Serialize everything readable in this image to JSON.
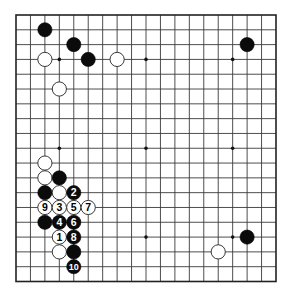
{
  "board": {
    "size": 19,
    "colors": {
      "background": "#ffffff",
      "line": "#3a3a3a",
      "black_stone": "#0b0b0b",
      "white_stone": "#ffffff"
    },
    "hoshi": [
      [
        3,
        3
      ],
      [
        9,
        3
      ],
      [
        15,
        3
      ],
      [
        3,
        9
      ],
      [
        9,
        9
      ],
      [
        15,
        9
      ],
      [
        3,
        15
      ],
      [
        9,
        15
      ],
      [
        15,
        15
      ]
    ],
    "stones": [
      {
        "col": 2,
        "row": 1,
        "color": "black",
        "label": ""
      },
      {
        "col": 4,
        "row": 2,
        "color": "black",
        "label": ""
      },
      {
        "col": 5,
        "row": 3,
        "color": "black",
        "label": ""
      },
      {
        "col": 2,
        "row": 3,
        "color": "white",
        "label": ""
      },
      {
        "col": 7,
        "row": 3,
        "color": "white",
        "label": ""
      },
      {
        "col": 3,
        "row": 5,
        "color": "white",
        "label": ""
      },
      {
        "col": 16,
        "row": 2,
        "color": "black",
        "label": ""
      },
      {
        "col": 2,
        "row": 10,
        "color": "white",
        "label": ""
      },
      {
        "col": 2,
        "row": 11,
        "color": "white",
        "label": ""
      },
      {
        "col": 3,
        "row": 11,
        "color": "black",
        "label": ""
      },
      {
        "col": 2,
        "row": 12,
        "color": "black",
        "label": ""
      },
      {
        "col": 3,
        "row": 12,
        "color": "white",
        "label": ""
      },
      {
        "col": 4,
        "row": 12,
        "color": "black",
        "label": "2"
      },
      {
        "col": 2,
        "row": 13,
        "color": "white",
        "label": "9"
      },
      {
        "col": 3,
        "row": 13,
        "color": "white",
        "label": "3"
      },
      {
        "col": 4,
        "row": 13,
        "color": "white",
        "label": "5"
      },
      {
        "col": 5,
        "row": 13,
        "color": "white",
        "label": "7"
      },
      {
        "col": 2,
        "row": 14,
        "color": "black",
        "label": ""
      },
      {
        "col": 3,
        "row": 14,
        "color": "black",
        "label": "4"
      },
      {
        "col": 4,
        "row": 14,
        "color": "black",
        "label": "6"
      },
      {
        "col": 3,
        "row": 15,
        "color": "white",
        "label": "1"
      },
      {
        "col": 4,
        "row": 15,
        "color": "black",
        "label": "8"
      },
      {
        "col": 3,
        "row": 16,
        "color": "white",
        "label": ""
      },
      {
        "col": 4,
        "row": 16,
        "color": "black",
        "label": ""
      },
      {
        "col": 4,
        "row": 17,
        "color": "black",
        "label": "10"
      },
      {
        "col": 16,
        "row": 15,
        "color": "black",
        "label": ""
      },
      {
        "col": 14,
        "row": 16,
        "color": "white",
        "label": ""
      }
    ]
  }
}
